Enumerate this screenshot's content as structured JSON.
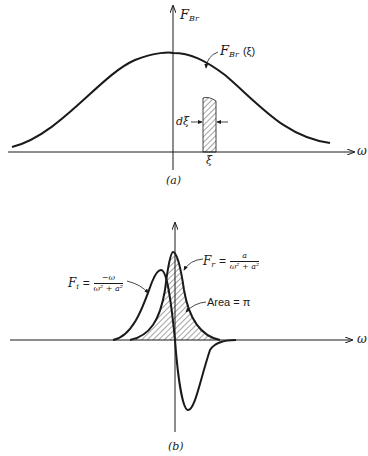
{
  "panel_a": {
    "caption": "(a)",
    "y_axis_label": "F",
    "y_axis_sub": "Br",
    "x_axis_label": "ω",
    "strip_label_main": "F",
    "strip_label_sub": "Br",
    "strip_label_arg": "(ξ)",
    "width_label": "dξ",
    "position_label": "ξ"
  },
  "panel_b": {
    "caption": "(b)",
    "x_axis_label": "ω",
    "fi_label": "F",
    "fi_sub": "i",
    "fi_eq": "=",
    "fi_num": "−ω",
    "fi_den": "ω² + a²",
    "fr_label": "F",
    "fr_sub": "r",
    "fr_eq": "=",
    "fr_num": "a",
    "fr_den": "ω² + a²",
    "area_label": "Area = π"
  },
  "colors": {
    "ink": "#1a1a1a",
    "background": "#ffffff"
  }
}
